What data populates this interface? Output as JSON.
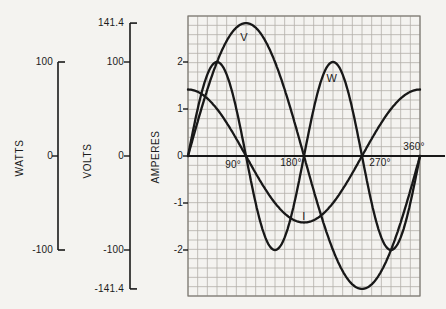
{
  "figure": {
    "colors": {
      "background": "#f4f3f0",
      "ink": "#181818",
      "grid": "#b3afa8",
      "grid_border": "#7e7a73"
    }
  },
  "axes_panel": {
    "watts": {
      "title": "WATTS",
      "units_per_value": 0.02,
      "ticks": [
        {
          "label": "100",
          "value": 100
        },
        {
          "label": "0",
          "value": 0
        },
        {
          "label": "-100",
          "value": -100
        }
      ]
    },
    "volts": {
      "title": "VOLTS",
      "units_per_value": 0.02,
      "ticks": [
        {
          "label": "141.4",
          "value": 141.4
        },
        {
          "label": "100",
          "value": 100
        },
        {
          "label": "0",
          "value": 0
        },
        {
          "label": "-100",
          "value": -100
        },
        {
          "label": "-141.4",
          "value": -141.4
        }
      ]
    },
    "amperes": {
      "title": "AMPERES",
      "units_per_value": 1,
      "ticks": [
        {
          "label": "2",
          "value": 2
        },
        {
          "label": "1",
          "value": 1
        },
        {
          "label": "0",
          "value": 0
        },
        {
          "label": "-1",
          "value": -1
        },
        {
          "label": "-2",
          "value": -2
        }
      ]
    }
  },
  "chart_data": {
    "type": "line",
    "title": "",
    "xlabel": "electrical degrees",
    "x_range": [
      0,
      360
    ],
    "grid": true,
    "x_ticks": [
      {
        "label": "90°",
        "value": 90
      },
      {
        "label": "180°",
        "value": 180
      },
      {
        "label": "270°",
        "value": 270
      },
      {
        "label": "360°",
        "value": 360
      }
    ],
    "series": [
      {
        "name": "V",
        "quantity": "voltage",
        "unit": "volts",
        "peak": 141.4,
        "waveform": "sine",
        "freq_multiple": 1,
        "phase_deg": 0,
        "plot_amplitude_units": 2.828,
        "x_deg": [
          0,
          30,
          60,
          90,
          120,
          150,
          180,
          210,
          240,
          270,
          300,
          330,
          360
        ],
        "values": [
          0,
          70.7,
          122.5,
          141.4,
          122.5,
          70.7,
          0,
          -70.7,
          -122.5,
          -141.4,
          -122.5,
          -70.7,
          0
        ]
      },
      {
        "name": "I",
        "quantity": "current",
        "unit": "amperes",
        "peak": 1.414,
        "waveform": "sine",
        "freq_multiple": 1,
        "phase_deg": 90,
        "plot_amplitude_units": 1.414,
        "x_deg": [
          0,
          30,
          60,
          90,
          120,
          150,
          180,
          210,
          240,
          270,
          300,
          330,
          360
        ],
        "values": [
          1.414,
          1.225,
          0.707,
          0,
          -0.707,
          -1.225,
          -1.414,
          -1.225,
          -0.707,
          0,
          0.707,
          1.225,
          1.414
        ]
      },
      {
        "name": "W",
        "quantity": "instantaneous power",
        "unit": "watts",
        "peak": 100,
        "waveform": "sine",
        "freq_multiple": 2,
        "phase_deg": 0,
        "plot_amplitude_units": 2.0,
        "x_deg": [
          0,
          30,
          60,
          90,
          120,
          150,
          180,
          210,
          240,
          270,
          300,
          330,
          360
        ],
        "values": [
          0,
          86.6,
          86.6,
          0,
          -86.6,
          -86.6,
          0,
          86.6,
          86.6,
          0,
          -86.6,
          -86.6,
          0
        ]
      }
    ],
    "annotations": [
      {
        "text": "V",
        "deg": 87,
        "units": 2.53
      },
      {
        "text": "W",
        "deg": 223,
        "units": 1.66
      },
      {
        "text": "I",
        "deg": 180,
        "units": -1.28
      }
    ]
  }
}
